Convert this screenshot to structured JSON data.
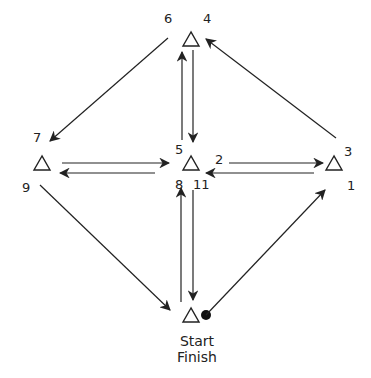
{
  "diagram": {
    "type": "route-network",
    "nodes": [
      {
        "id": "top",
        "labels": [
          "6",
          "4"
        ]
      },
      {
        "id": "left",
        "labels": [
          "7",
          "9"
        ]
      },
      {
        "id": "center",
        "labels": [
          "5",
          "8",
          "11",
          "2"
        ]
      },
      {
        "id": "right",
        "labels": [
          "3",
          "1"
        ]
      },
      {
        "id": "bottom",
        "labels": [
          "Start",
          "Finish"
        ]
      }
    ],
    "labels": {
      "n6": "6",
      "n4": "4",
      "n7": "7",
      "n9": "9",
      "n5": "5",
      "n8": "8",
      "n11": "11",
      "n2": "2",
      "n3": "3",
      "n1": "1",
      "start": "Start",
      "finish": "Finish"
    },
    "edges": [
      {
        "from": "bottom",
        "to": "right",
        "step": "1"
      },
      {
        "from": "right",
        "to": "center",
        "step": "2"
      },
      {
        "from": "center",
        "to": "right",
        "step": "3"
      },
      {
        "from": "right",
        "to": "top",
        "step": "4"
      },
      {
        "from": "top",
        "to": "center",
        "step": "5"
      },
      {
        "from": "center",
        "to": "top",
        "step": "6"
      },
      {
        "from": "top",
        "to": "left",
        "step": "7"
      },
      {
        "from": "left",
        "to": "center",
        "step": "8"
      },
      {
        "from": "center",
        "to": "left",
        "step": "9"
      },
      {
        "from": "left",
        "to": "bottom",
        "step": "10"
      },
      {
        "from": "bottom",
        "to": "center",
        "step": "11"
      },
      {
        "from": "center",
        "to": "bottom",
        "step": "12"
      }
    ],
    "colors": {
      "stroke": "#222222",
      "background": "#ffffff"
    }
  }
}
